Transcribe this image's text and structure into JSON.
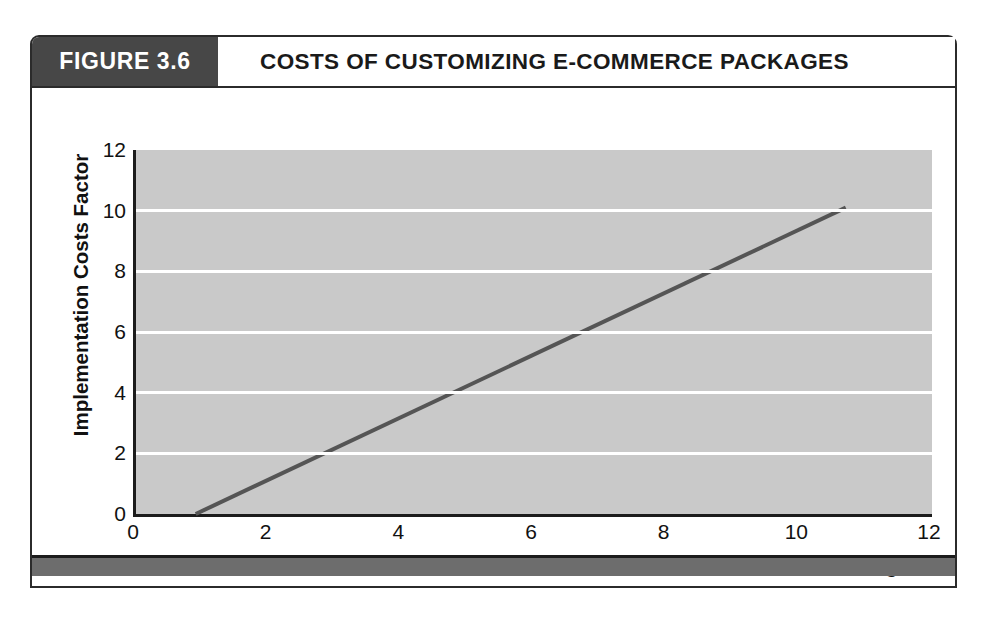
{
  "figure": {
    "tag_label": "FIGURE 3.6",
    "title": "COSTS OF CUSTOMIZING E-COMMERCE PACKAGES",
    "tag_bg_color": "#474747",
    "frame_color": "#2b2b2b",
    "bottom_bar_color": "#6d6d6d"
  },
  "chart_data": {
    "type": "line",
    "title": "COSTS OF CUSTOMIZING E-COMMERCE PACKAGES",
    "subtitle": "",
    "xlabel": "Percent Lines of Code Changed",
    "ylabel": "Implementation Costs Factor",
    "xlim": [
      0,
      12
    ],
    "ylim": [
      0,
      12
    ],
    "xticks": [
      0,
      2,
      4,
      6,
      8,
      10,
      12
    ],
    "yticks": [
      0,
      2,
      4,
      6,
      8,
      10,
      12
    ],
    "xticklabels": [
      "0",
      "2",
      "4",
      "6",
      "8",
      "10",
      "12"
    ],
    "yticklabels": [
      "0",
      "2",
      "4",
      "6",
      "8",
      "10",
      "12"
    ],
    "grid": true,
    "grid_orientation": "horizontal",
    "grid_color": "#ffffff",
    "plot_bg_color": "#c9c9c9",
    "legend": false,
    "legend_position": "none",
    "series": [
      {
        "name": "Implementation Costs Factor",
        "color": "#555555",
        "line_width": 4,
        "x": [
          0.9,
          10.7
        ],
        "y": [
          0.0,
          10.1
        ],
        "points": [
          {
            "x": 0.9,
            "y": 0.0
          },
          {
            "x": 10.7,
            "y": 10.1
          }
        ]
      }
    ]
  }
}
